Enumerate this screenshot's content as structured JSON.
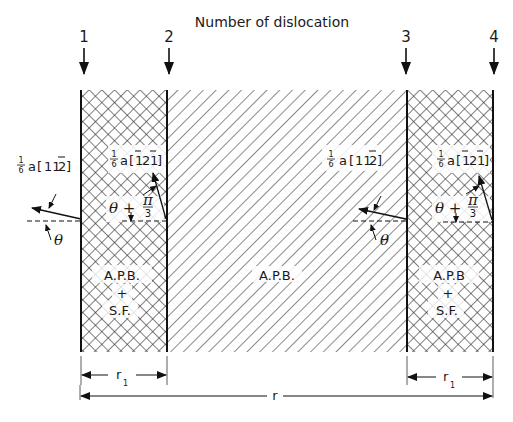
{
  "diagram": {
    "title": "Number of dislocation",
    "dislocations": [
      {
        "label": "1",
        "x": 81
      },
      {
        "label": "2",
        "x": 167
      },
      {
        "label": "3",
        "x": 407
      },
      {
        "label": "4",
        "x": 493
      }
    ],
    "regions": {
      "left": {
        "label_line1": "A.P.B.",
        "label_line2": "+",
        "label_line3": "S.F.",
        "pattern": "cross-hatch"
      },
      "middle": {
        "label": "A.P.B.",
        "pattern": "diagonal-hatch"
      },
      "right": {
        "label_line1": "A.P.B",
        "label_line2": "+",
        "label_line3": "S.F.",
        "pattern": "cross-hatch"
      }
    },
    "burgers_vectors": {
      "dislocation_1": {
        "prefix_num": "1",
        "prefix_den": "6",
        "a": "a",
        "indices": "11¯2",
        "display": "1/6 a[11ŷ2]"
      },
      "dislocation_2": {
        "prefix_num": "1",
        "prefix_den": "6",
        "a": "a",
        "indices": "¯12¯1",
        "display": "1/6 a[ī2ī]"
      },
      "dislocation_3": {
        "prefix_num": "1",
        "prefix_den": "6",
        "a": "a",
        "indices": "11¯2",
        "display": "1/6 a[11ŷ2]"
      },
      "dislocation_4": {
        "prefix_num": "1",
        "prefix_den": "6",
        "a": "a",
        "indices": "¯12¯1",
        "display": "1/6 a[ī2ī]"
      }
    },
    "angles": {
      "theta": "θ",
      "theta_plus": "θ +",
      "pi_num": "π",
      "pi_den": "3"
    },
    "dimensions": {
      "r1_label": "r",
      "r1_subscript": "1",
      "r_label": "r"
    }
  }
}
